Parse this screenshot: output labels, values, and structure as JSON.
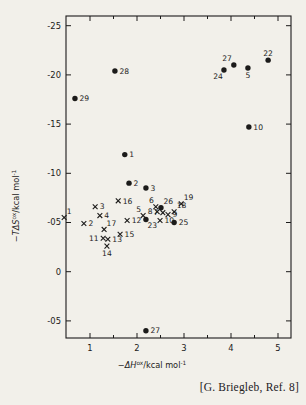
{
  "page": {
    "caption": "[G. Briegleb, Ref. 8]",
    "ink_color": "#1c1b1a",
    "background_color": "#f2f0ea"
  },
  "chart_data": {
    "type": "scatter",
    "title": "",
    "xlabel": {
      "minus": "−",
      "var": "ΔH",
      "sup": "ox",
      "rest": "/kcal mol",
      "rest_sup": "-1"
    },
    "ylabel": {
      "minus": "−",
      "var": "TΔS",
      "sup": "ox",
      "rest": "/kcal mol",
      "rest_sup": "-1"
    },
    "x_ticks": [
      {
        "v": 1,
        "label": "1"
      },
      {
        "v": 2,
        "label": "2"
      },
      {
        "v": 3,
        "label": "3"
      },
      {
        "v": 4,
        "label": "4"
      },
      {
        "v": 5,
        "label": "5"
      }
    ],
    "x_minor_ticks": [
      1.5,
      2.5,
      3.5,
      4.5
    ],
    "y_ticks": [
      {
        "v": -25,
        "label": "-25"
      },
      {
        "v": -20,
        "label": "-20"
      },
      {
        "v": -15,
        "label": "-15"
      },
      {
        "v": -10,
        "label": "-10"
      },
      {
        "v": -5,
        "label": "-05"
      },
      {
        "v": 0,
        "label": "0"
      },
      {
        "v": 5,
        "label": "-05"
      }
    ],
    "xlim": [
      0.49,
      5.28
    ],
    "ylim": [
      -26.0,
      6.7
    ],
    "grid": false,
    "legend": "none",
    "series": [
      {
        "name": "filled-circle-series",
        "marker": "circle",
        "points": [
          {
            "label": "28",
            "x": 1.53,
            "y": -20.4,
            "pos": "r"
          },
          {
            "label": "29",
            "x": 0.68,
            "y": -17.6,
            "pos": "r"
          },
          {
            "label": "24",
            "x": 3.85,
            "y": -20.5,
            "pos": "bl"
          },
          {
            "label": "27",
            "x": 4.06,
            "y": -21.0,
            "pos": "al"
          },
          {
            "label": "5",
            "x": 4.36,
            "y": -20.7,
            "pos": "b"
          },
          {
            "label": "22",
            "x": 4.79,
            "y": -21.5,
            "pos": "a"
          },
          {
            "label": "10",
            "x": 4.38,
            "y": -14.7,
            "pos": "r"
          },
          {
            "label": "1",
            "x": 1.74,
            "y": -11.9,
            "pos": "r"
          },
          {
            "label": "2",
            "x": 1.83,
            "y": -9.0,
            "pos": "r"
          },
          {
            "label": "3",
            "x": 2.19,
            "y": -8.5,
            "pos": "r"
          },
          {
            "label": "26",
            "x": 2.51,
            "y": -6.5,
            "pos": "ar"
          },
          {
            "label": "23",
            "x": 2.19,
            "y": -5.3,
            "pos": "br"
          },
          {
            "label": "25",
            "x": 2.79,
            "y": -5.0,
            "pos": "r"
          },
          {
            "label": "27",
            "x": 2.19,
            "y": 6.0,
            "pos": "r"
          }
        ]
      },
      {
        "name": "cross-series",
        "marker": "x",
        "points": [
          {
            "label": "1",
            "x": 0.45,
            "y": -5.5,
            "pos": "ar"
          },
          {
            "label": "2",
            "x": 0.87,
            "y": -4.9,
            "pos": "r"
          },
          {
            "label": "3",
            "x": 1.11,
            "y": -6.6,
            "pos": "r"
          },
          {
            "label": "4",
            "x": 1.21,
            "y": -5.7,
            "pos": "r"
          },
          {
            "label": "16",
            "x": 1.6,
            "y": -7.2,
            "pos": "r"
          },
          {
            "label": "12",
            "x": 1.79,
            "y": -5.2,
            "pos": "r"
          },
          {
            "label": "17",
            "x": 1.3,
            "y": -4.3,
            "pos": "ar"
          },
          {
            "label": "11",
            "x": 1.28,
            "y": -3.4,
            "pos": "l"
          },
          {
            "label": "13",
            "x": 1.38,
            "y": -3.3,
            "pos": "r"
          },
          {
            "label": "14",
            "x": 1.36,
            "y": -2.6,
            "pos": "b"
          },
          {
            "label": "15",
            "x": 1.64,
            "y": -3.8,
            "pos": "r"
          },
          {
            "label": "5",
            "x": 2.13,
            "y": -5.7,
            "pos": "al"
          },
          {
            "label": "6",
            "x": 2.4,
            "y": -6.6,
            "pos": "al"
          },
          {
            "label": "8",
            "x": 2.43,
            "y": -6.1,
            "pos": "l"
          },
          {
            "label": "7",
            "x": 2.55,
            "y": -6.0,
            "pos": "l"
          },
          {
            "label": "9",
            "x": 2.66,
            "y": -5.8,
            "pos": "r"
          },
          {
            "label": "18",
            "x": 2.79,
            "y": -6.1,
            "pos": "ar"
          },
          {
            "label": "19",
            "x": 2.94,
            "y": -6.9,
            "pos": "ar"
          },
          {
            "label": "10",
            "x": 2.49,
            "y": -5.2,
            "pos": "r"
          }
        ]
      }
    ]
  }
}
